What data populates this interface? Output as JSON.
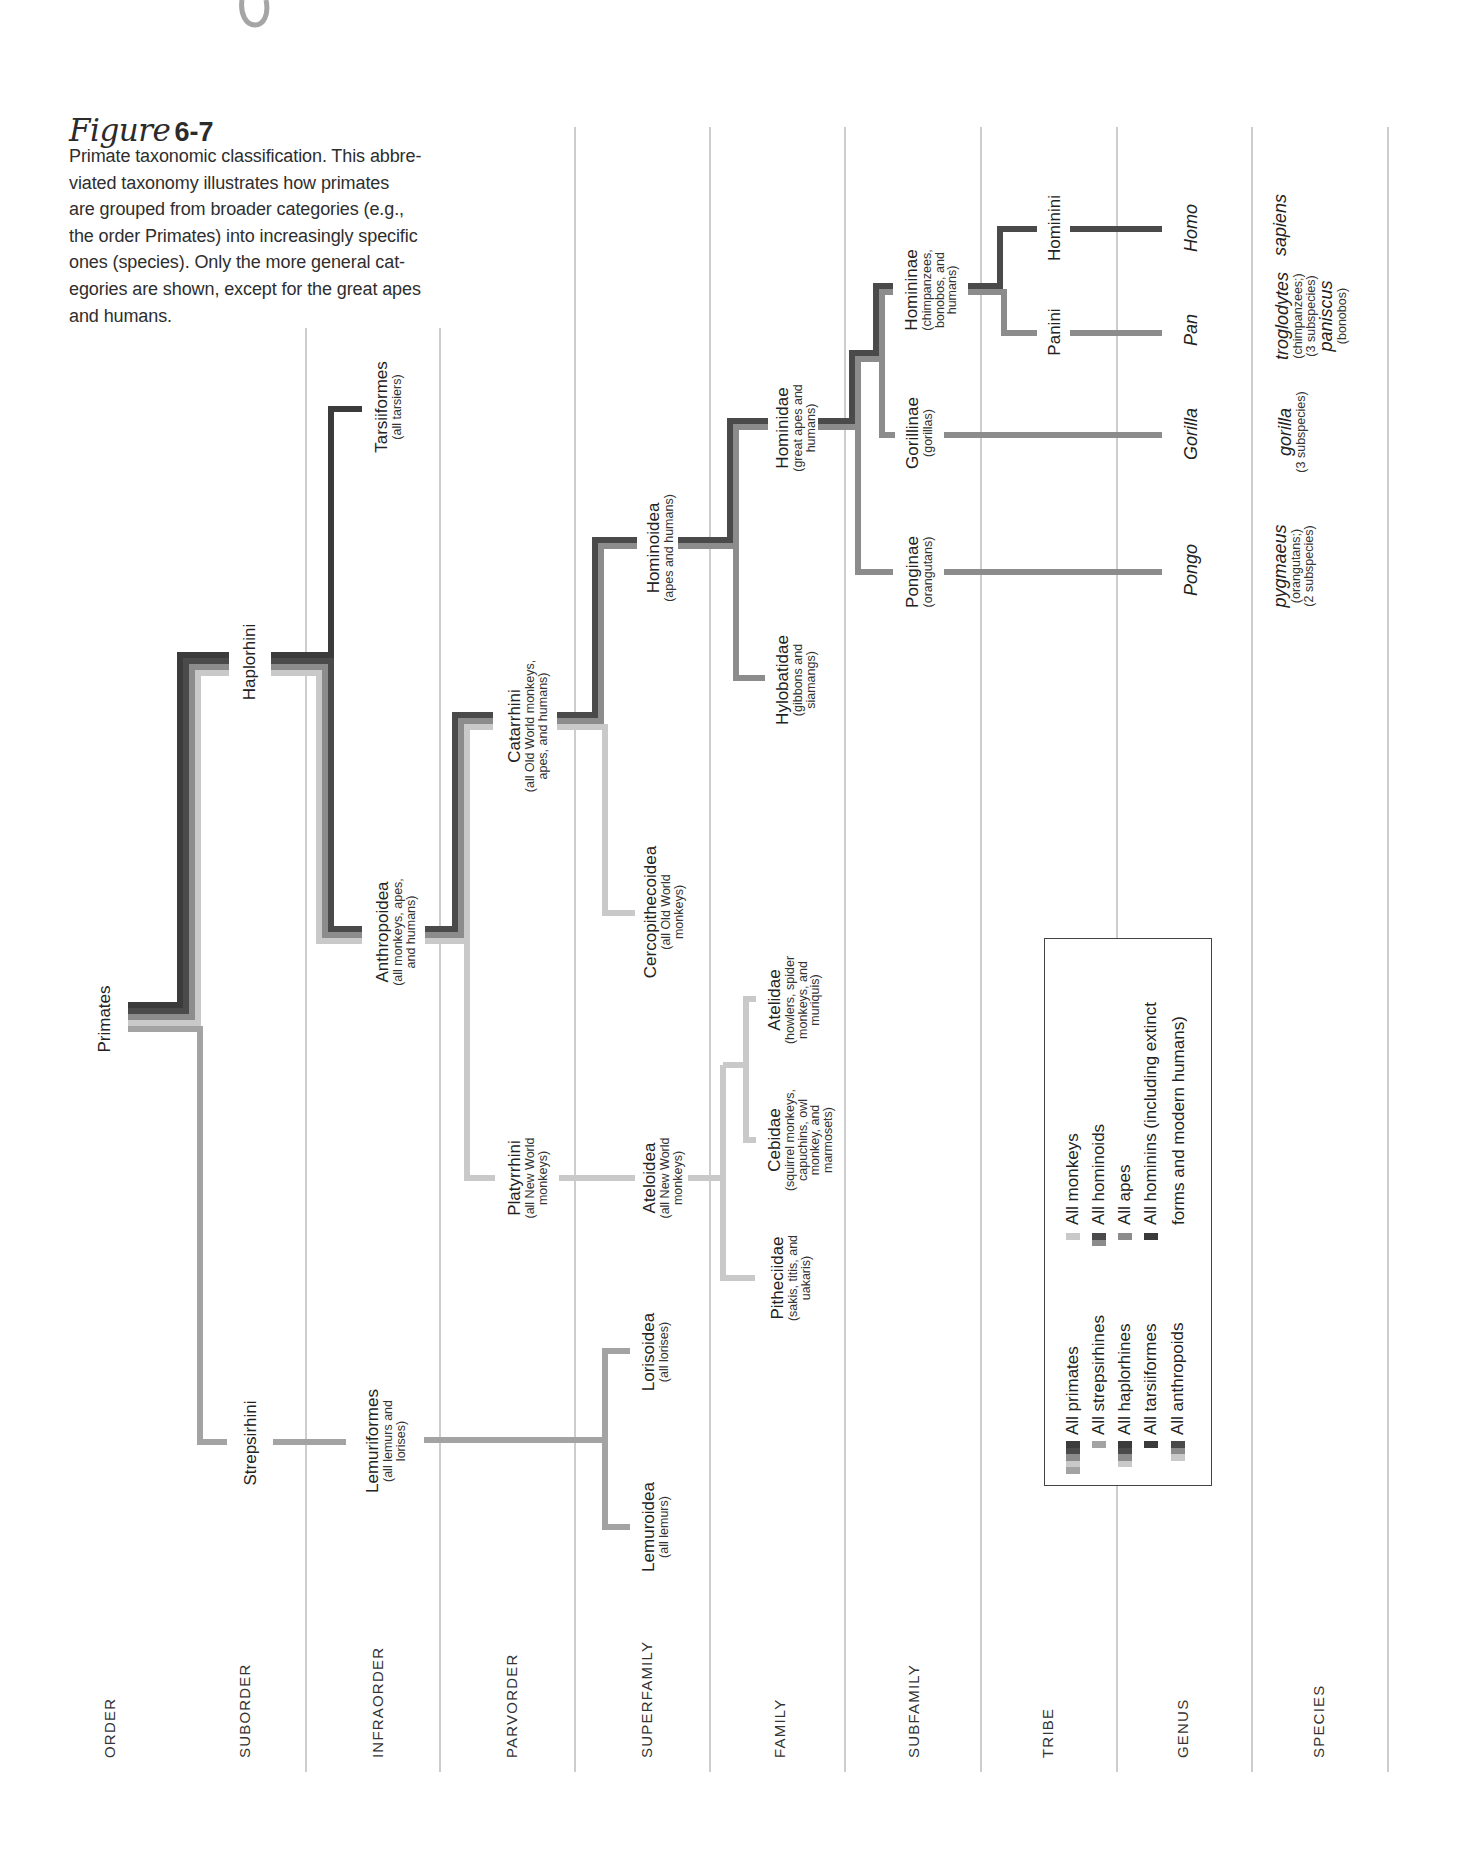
{
  "figure": {
    "title_script": "Figure",
    "title_number": "6-7",
    "caption_lines": [
      "Primate taxonomic classification. This abbre-",
      "viated taxonomy illustrates how primates",
      "are grouped from broader categories (e.g.,",
      "the order Primates) into increasingly specific",
      "ones (species). Only the more general cat-",
      "egories are shown, except for the great apes",
      "and humans."
    ]
  },
  "ranks": [
    "ORDER",
    "SUBORDER",
    "INFRAORDER",
    "PARVORDER",
    "SUPERFAMILY",
    "FAMILY",
    "SUBFAMILY",
    "TRIBE",
    "GENUS",
    "SPECIES"
  ],
  "taxa": {
    "primates": {
      "name": "Primates"
    },
    "haplorhini": {
      "name": "Haplorhini"
    },
    "strepsirhini": {
      "name": "Strepsirhini"
    },
    "tarsiiformes": {
      "name": "Tarsiiformes",
      "notes": [
        "(all tarsiers)"
      ]
    },
    "anthropoidea": {
      "name": "Anthropoidea",
      "notes": [
        "(all monkeys, apes,",
        "and humans)"
      ]
    },
    "lemuriformes": {
      "name": "Lemuriformes",
      "notes": [
        "(all lemurs and",
        "lorises)"
      ]
    },
    "catarrhini": {
      "name": "Catarrhini",
      "notes": [
        "(all Old World monkeys,",
        "apes, and humans)"
      ]
    },
    "platyrrhini": {
      "name": "Platyrrhini",
      "notes": [
        "(all New World",
        "monkeys)"
      ]
    },
    "hominoidea": {
      "name": "Hominoidea",
      "notes": [
        "(apes and humans)"
      ]
    },
    "cercopithecoidea": {
      "name": "Cercopithecoidea",
      "notes": [
        "(all Old World",
        "monkeys)"
      ]
    },
    "ateloidea": {
      "name": "Ateloidea",
      "notes": [
        "(all New World",
        "monkeys)"
      ]
    },
    "lorisoidea": {
      "name": "Lorisoidea",
      "notes": [
        "(all lorises)"
      ]
    },
    "lemuroidea": {
      "name": "Lemuroidea",
      "notes": [
        "(all lemurs)"
      ]
    },
    "hominidae": {
      "name": "Hominidae",
      "notes": [
        "(great apes and",
        "humans)"
      ]
    },
    "hylobatidae": {
      "name": "Hylobatidae",
      "notes": [
        "(gibbons and",
        "siamangs)"
      ]
    },
    "atelidae": {
      "name": "Atelidae",
      "notes": [
        "(howlers, spider",
        "monkeys, and",
        "muriquis)"
      ]
    },
    "cebidae": {
      "name": "Cebidae",
      "notes": [
        "(squirrel monkeys,",
        "capuchins, owl",
        "monkey, and",
        "marmosets)"
      ]
    },
    "pitheciidae": {
      "name": "Pitheciidae",
      "notes": [
        "(sakis, titis, and",
        "uakaris)"
      ]
    },
    "homininae": {
      "name": "Homininae",
      "notes": [
        "(chimpanzees,",
        "bonobos, and",
        "humans)"
      ]
    },
    "gorillinae": {
      "name": "Gorillinae",
      "notes": [
        "(gorillas)"
      ]
    },
    "ponginae": {
      "name": "Ponginae",
      "notes": [
        "(orangutans)"
      ]
    },
    "hominini": {
      "name": "Hominini"
    },
    "panini": {
      "name": "Panini"
    }
  },
  "genera": {
    "homo": "Homo",
    "pan": "Pan",
    "gorilla": "Gorilla",
    "pongo": "Pongo"
  },
  "species": {
    "sapiens": {
      "name": "sapiens"
    },
    "troglodytes": {
      "name": "troglodytes",
      "notes": [
        "(chimpanzees;)",
        "(3 subspecies)"
      ]
    },
    "paniscus": {
      "name": "paniscus",
      "notes": [
        "(bonobos)"
      ]
    },
    "gorilla": {
      "name": "gorilla",
      "notes": [
        "(3 subspecies)"
      ]
    },
    "pygmaeus": {
      "name": "pygmaeus",
      "notes": [
        "(orangutans;)",
        "(2 subspecies)"
      ]
    }
  },
  "palette": {
    "tarsiiform": "#3b3b3b",
    "hominin": "#4a4a4a",
    "ape": "#8c8c8c",
    "monkey": "#c9c9c9",
    "strepsirhine": "#a3a3a3",
    "grid": "#bdbdbd"
  },
  "legend": {
    "items": [
      {
        "label": "All primates",
        "colors": [
          "#3b3b3b",
          "#4a4a4a",
          "#8c8c8c",
          "#c9c9c9",
          "#a3a3a3"
        ]
      },
      {
        "label": "All strepsirhines",
        "colors": [
          "#a3a3a3"
        ]
      },
      {
        "label": "All haplorhines",
        "colors": [
          "#3b3b3b",
          "#4a4a4a",
          "#8c8c8c",
          "#c9c9c9"
        ]
      },
      {
        "label": "All tarsiiformes",
        "colors": [
          "#3b3b3b"
        ]
      },
      {
        "label": "All anthropoids",
        "colors": [
          "#4a4a4a",
          "#8c8c8c",
          "#c9c9c9"
        ]
      },
      {
        "label": "All monkeys",
        "colors": [
          "#c9c9c9"
        ]
      },
      {
        "label": "All hominoids",
        "colors": [
          "#4a4a4a",
          "#8c8c8c"
        ]
      },
      {
        "label": "All apes",
        "colors": [
          "#8c8c8c"
        ]
      },
      {
        "label": "All hominins (including extinct",
        "label_line2": "forms and modern humans)",
        "colors": [
          "#3a3a3a"
        ]
      }
    ]
  },
  "tree": {
    "stroke_width": 6,
    "grid": {
      "x": [
        306,
        440,
        575,
        710,
        845,
        981,
        1117,
        1252,
        1388
      ],
      "top": [
        328,
        328,
        127,
        127,
        127,
        127,
        127,
        127,
        127
      ],
      "bottom": 1772
    },
    "branches": [
      {
        "clade": "strepsirhine",
        "stroke": "strepsirhine",
        "points": "128,1029 200,1029 200,1442 227,1442"
      },
      {
        "clade": "strepsirhine",
        "stroke": "strepsirhine",
        "points": "273,1442 346,1442"
      },
      {
        "clade": "strepsirhine",
        "stroke": "strepsirhine",
        "points": "424,1440 605,1440"
      },
      {
        "clade": "strepsirhine",
        "stroke": "strepsirhine",
        "points": "630,1351 605,1351 605,1527 630,1527"
      },
      {
        "clade": "monkey",
        "stroke": "monkey",
        "points": "128,1023 198,1023 198,673 229,673"
      },
      {
        "clade": "monkey",
        "stroke": "monkey",
        "points": "271,673 319,673 319,941 362,941"
      },
      {
        "clade": "monkey",
        "stroke": "monkey",
        "points": "425,941 467,941 467,727 493,727"
      },
      {
        "clade": "monkey",
        "stroke": "monkey",
        "points": "467,941 467,1178 495,1178"
      },
      {
        "clade": "monkey",
        "stroke": "monkey",
        "points": "557,727 605,727 605,913 635,913"
      },
      {
        "clade": "monkey",
        "stroke": "monkey",
        "points": "559,1178 635,1178"
      },
      {
        "clade": "monkey",
        "stroke": "monkey",
        "points": "688,1178 723,1178"
      },
      {
        "clade": "monkey",
        "stroke": "monkey",
        "points": "723,1065 723,1278 755,1278"
      },
      {
        "clade": "monkey",
        "stroke": "monkey",
        "points": "723,1065 746,1065"
      },
      {
        "clade": "monkey",
        "stroke": "monkey",
        "points": "756,999 746,999 746,1140 756,1140"
      },
      {
        "clade": "ape",
        "stroke": "ape",
        "points": "128,1017 192,1017 192,667 229,667"
      },
      {
        "clade": "ape",
        "stroke": "ape",
        "points": "271,667 325,667 325,935 362,935"
      },
      {
        "clade": "ape",
        "stroke": "ape",
        "points": "425,935 461,935 461,721 493,721"
      },
      {
        "clade": "ape",
        "stroke": "ape",
        "points": "557,721 601,721 601,546 637,546"
      },
      {
        "clade": "ape",
        "stroke": "ape",
        "points": "678,546 736,546 736,427 768,427"
      },
      {
        "clade": "ape",
        "stroke": "ape",
        "points": "736,546 736,678 765,678"
      },
      {
        "clade": "ape",
        "stroke": "ape",
        "points": "818,427 858,427 858,359 882,359 882,292 893,292"
      },
      {
        "clade": "ape",
        "stroke": "ape",
        "points": "858,427 858,572 893,572"
      },
      {
        "clade": "ape",
        "stroke": "ape",
        "points": "882,359 882,435 895,435"
      },
      {
        "clade": "ape",
        "stroke": "ape",
        "points": "968,292 1004,292 1004,333 1037,333"
      },
      {
        "clade": "ape",
        "stroke": "ape",
        "points": "1070,333 1162,333"
      },
      {
        "clade": "ape",
        "stroke": "ape",
        "points": "944,435 1162,435"
      },
      {
        "clade": "ape",
        "stroke": "ape",
        "points": "944,572 1162,572"
      },
      {
        "clade": "hominin",
        "stroke": "hominin",
        "points": "128,1011 186,1011 186,661 229,661"
      },
      {
        "clade": "hominin",
        "stroke": "hominin",
        "points": "271,661 331,661 331,929 362,929"
      },
      {
        "clade": "hominin",
        "stroke": "hominin",
        "points": "425,929 455,929 455,715 493,715"
      },
      {
        "clade": "hominin",
        "stroke": "hominin",
        "points": "557,715 595,715 595,540 637,540"
      },
      {
        "clade": "hominin",
        "stroke": "hominin",
        "points": "678,540 730,540 730,421 768,421"
      },
      {
        "clade": "hominin",
        "stroke": "hominin",
        "points": "818,421 852,421 852,353 876,353 876,286 893,286"
      },
      {
        "clade": "hominin",
        "stroke": "hominin",
        "points": "968,286 1000,286 1000,229 1037,229"
      },
      {
        "clade": "hominin",
        "stroke": "hominin",
        "points": "1070,229 1162,229"
      },
      {
        "clade": "tarsiiform",
        "stroke": "tarsiiform",
        "points": "128,1005 180,1005 180,655 229,655"
      },
      {
        "clade": "tarsiiform",
        "stroke": "tarsiiform",
        "points": "271,655 331,655 331,409 362,409"
      }
    ]
  }
}
